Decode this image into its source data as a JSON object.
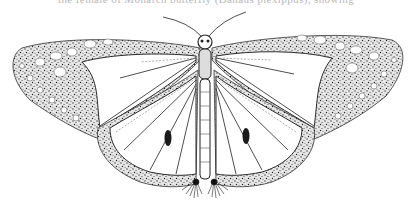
{
  "page": {
    "top_text_fragment": "the female of Monarch butterfly (Danaus plexippus), showing"
  },
  "illustration": {
    "subject": "Monarch butterfly, dorsal view, pen-and-ink stipple drawing",
    "features": [
      "antennae",
      "head",
      "thorax",
      "abdomen",
      "forewings",
      "hindwings",
      "hindwing scent patches",
      "leg tufts"
    ],
    "ink_color": "#2a2a2a",
    "paper_color": "#ffffff"
  }
}
